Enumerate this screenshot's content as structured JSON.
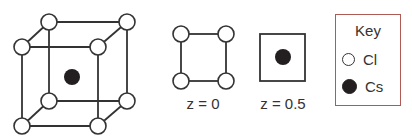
{
  "figure": {
    "colors": {
      "line": "#333333",
      "open_atom_fill": "#ffffff",
      "filled_atom": "#231f20",
      "key_border": "#b05a55"
    }
  },
  "layers": [
    {
      "label": "z = 0"
    },
    {
      "label": "z = 0.5"
    }
  ],
  "key": {
    "title": "Key",
    "items": [
      {
        "symbol": "open-circle",
        "label": "Cl"
      },
      {
        "symbol": "filled-circle",
        "label": "Cs"
      }
    ]
  }
}
